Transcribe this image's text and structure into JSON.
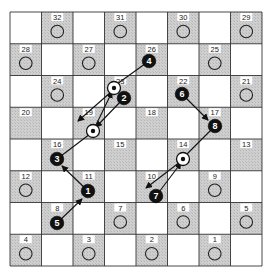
{
  "board": {
    "origin": [
      10,
      12
    ],
    "cell_w": 31.5,
    "cell_h": 31.75,
    "rows": 8,
    "cols": 8,
    "light_color": "#ffffff",
    "dark_color": "#c9c9c9",
    "line_color": "#333333"
  },
  "squares": [
    {
      "num": "32",
      "row": 0,
      "col": 1,
      "circle": true
    },
    {
      "num": "31",
      "row": 0,
      "col": 3,
      "circle": true
    },
    {
      "num": "30",
      "row": 0,
      "col": 5,
      "circle": true
    },
    {
      "num": "29",
      "row": 0,
      "col": 7,
      "circle": true
    },
    {
      "num": "28",
      "row": 1,
      "col": 0,
      "circle": true
    },
    {
      "num": "27",
      "row": 1,
      "col": 2,
      "circle": true
    },
    {
      "num": "26",
      "row": 1,
      "col": 4,
      "circle": false
    },
    {
      "num": "25",
      "row": 1,
      "col": 6,
      "circle": true
    },
    {
      "num": "24",
      "row": 2,
      "col": 1,
      "circle": true
    },
    {
      "num": "23",
      "row": 2,
      "col": 3,
      "circle": false
    },
    {
      "num": "22",
      "row": 2,
      "col": 5,
      "circle": false
    },
    {
      "num": "21",
      "row": 2,
      "col": 7,
      "circle": true
    },
    {
      "num": "20",
      "row": 3,
      "col": 0,
      "circle": false
    },
    {
      "num": "19",
      "row": 3,
      "col": 2,
      "circle": false
    },
    {
      "num": "18",
      "row": 3,
      "col": 4,
      "circle": false
    },
    {
      "num": "17",
      "row": 3,
      "col": 6,
      "circle": false
    },
    {
      "num": "16",
      "row": 4,
      "col": 1,
      "circle": false
    },
    {
      "num": "15",
      "row": 4,
      "col": 3,
      "circle": false
    },
    {
      "num": "14",
      "row": 4,
      "col": 5,
      "circle": false
    },
    {
      "num": "13",
      "row": 4,
      "col": 7,
      "circle": false
    },
    {
      "num": "12",
      "row": 5,
      "col": 0,
      "circle": true
    },
    {
      "num": "11",
      "row": 5,
      "col": 2,
      "circle": false
    },
    {
      "num": "10",
      "row": 5,
      "col": 4,
      "circle": false
    },
    {
      "num": "9",
      "row": 5,
      "col": 6,
      "circle": true
    },
    {
      "num": "8",
      "row": 6,
      "col": 1,
      "circle": false
    },
    {
      "num": "7",
      "row": 6,
      "col": 3,
      "circle": true
    },
    {
      "num": "6",
      "row": 6,
      "col": 5,
      "circle": true
    },
    {
      "num": "5",
      "row": 6,
      "col": 7,
      "circle": true
    },
    {
      "num": "4",
      "row": 7,
      "col": 0,
      "circle": true
    },
    {
      "num": "3",
      "row": 7,
      "col": 2,
      "circle": true
    },
    {
      "num": "2",
      "row": 7,
      "col": 4,
      "circle": true
    },
    {
      "num": "1",
      "row": 7,
      "col": 6,
      "circle": true
    }
  ],
  "waypoints": [
    {
      "id": "w23",
      "square": "23",
      "x": 114,
      "y": 88
    },
    {
      "id": "w19",
      "square": "19",
      "x": 93,
      "y": 131
    },
    {
      "id": "w14",
      "square": "14",
      "x": 183,
      "y": 159
    }
  ],
  "pieces": [
    {
      "label": "1",
      "square": "11",
      "x": 88,
      "y": 191
    },
    {
      "label": "2",
      "square": "23",
      "x": 124,
      "y": 98
    },
    {
      "label": "3",
      "square": "16",
      "x": 57,
      "y": 159
    },
    {
      "label": "4",
      "square": "26",
      "x": 149,
      "y": 61
    },
    {
      "label": "5",
      "square": "8",
      "x": 57,
      "y": 223
    },
    {
      "label": "6",
      "square": "22",
      "x": 182,
      "y": 94
    },
    {
      "label": "7",
      "square": "10",
      "x": 156,
      "y": 196
    },
    {
      "label": "8",
      "square": "17",
      "x": 215,
      "y": 126
    }
  ],
  "arrows": [
    {
      "from": [
        149,
        61
      ],
      "to": [
        117,
        84
      ],
      "head": false
    },
    {
      "from": [
        111,
        92
      ],
      "to": [
        78,
        121
      ],
      "head": true
    },
    {
      "from": [
        124,
        98
      ],
      "to": [
        96,
        127
      ],
      "head": true
    },
    {
      "from": [
        57,
        159
      ],
      "to": [
        90,
        134
      ],
      "head": false
    },
    {
      "from": [
        95,
        127
      ],
      "to": [
        112,
        92
      ],
      "head": true
    },
    {
      "from": [
        88,
        191
      ],
      "to": [
        62,
        166
      ],
      "head": true
    },
    {
      "from": [
        57,
        223
      ],
      "to": [
        82,
        199
      ],
      "head": true
    },
    {
      "from": [
        182,
        94
      ],
      "to": [
        208,
        120
      ],
      "head": true
    },
    {
      "from": [
        215,
        126
      ],
      "to": [
        186,
        155
      ],
      "head": false
    },
    {
      "from": [
        180,
        162
      ],
      "to": [
        146,
        188
      ],
      "head": true
    },
    {
      "from": [
        156,
        196
      ],
      "to": [
        181,
        163
      ],
      "head": true
    }
  ]
}
